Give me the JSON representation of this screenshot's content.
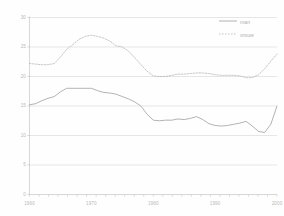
{
  "chart_data": {
    "type": "line",
    "title": "",
    "subtitle": "",
    "xlabel": "",
    "ylabel": "",
    "ylim": [
      0,
      30
    ],
    "yticks": [
      0,
      5,
      10,
      15,
      20,
      25,
      30
    ],
    "ytick_labels": [
      "0",
      "5",
      "10",
      "15",
      "20",
      "25",
      "30"
    ],
    "grid": true,
    "grid_axis": "y",
    "legend_position": "top-right",
    "xlim": [
      1960,
      2000
    ],
    "xticks": [
      1960,
      1970,
      1980,
      1990,
      2000
    ],
    "xtick_labels": [
      "1960",
      "1970",
      "1980",
      "1990",
      "2000"
    ],
    "minor_tick_count": 27,
    "x": [
      1960,
      1961,
      1962,
      1963,
      1964,
      1965,
      1966,
      1967,
      1968,
      1969,
      1970,
      1971,
      1972,
      1973,
      1974,
      1975,
      1976,
      1977,
      1978,
      1979,
      1980,
      1981,
      1982,
      1983,
      1984,
      1985,
      1986,
      1987,
      1988,
      1989,
      1990,
      1991,
      1992,
      1993,
      1994,
      1995,
      1996,
      1997,
      1998,
      1999,
      2000
    ],
    "series": [
      {
        "name": "man",
        "style": "solid",
        "color": "#9a9a9a",
        "values": [
          15.2,
          15.4,
          15.9,
          16.3,
          16.6,
          17.4,
          18.0,
          18.0,
          18.0,
          18.0,
          18.0,
          17.6,
          17.3,
          17.2,
          17.0,
          16.6,
          16.2,
          15.7,
          15.0,
          13.6,
          12.6,
          12.5,
          12.6,
          12.6,
          12.8,
          12.7,
          12.9,
          13.2,
          12.7,
          12.0,
          11.7,
          11.6,
          11.7,
          11.9,
          12.1,
          12.4,
          11.6,
          10.7,
          10.5,
          11.9,
          15.0
        ]
      },
      {
        "name": "vrouw",
        "style": "dotted",
        "color": "#b4b4b4",
        "values": [
          22.2,
          22.1,
          22.0,
          22.0,
          22.2,
          23.3,
          24.6,
          25.4,
          26.3,
          26.8,
          27.0,
          26.8,
          26.5,
          26.0,
          25.2,
          25.0,
          24.3,
          23.2,
          22.0,
          20.9,
          20.1,
          20.0,
          20.0,
          20.2,
          20.4,
          20.4,
          20.5,
          20.6,
          20.6,
          20.5,
          20.3,
          20.2,
          20.2,
          20.2,
          20.1,
          19.8,
          19.8,
          20.3,
          21.3,
          22.6,
          23.8
        ]
      }
    ]
  },
  "legend": {
    "items": [
      {
        "label": "man"
      },
      {
        "label": "vrouw"
      }
    ]
  },
  "colors": {
    "man_line": "#9a9a9a",
    "vrouw_line": "#b4b4b4",
    "grid": "#cfcfcf",
    "axis": "#bdbdbd",
    "tick_text": "#b9b9b9",
    "background": "#fefefe"
  }
}
